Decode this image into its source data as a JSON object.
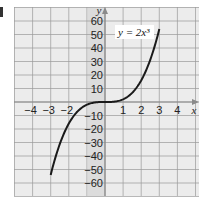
{
  "corner_label": "1",
  "chart_data": {
    "type": "line",
    "title": "",
    "equation_label": "y = 2x³",
    "xlabel": "x",
    "ylabel": "y",
    "xlim": [
      -5,
      5
    ],
    "ylim": [
      -70,
      70
    ],
    "x_ticks": [
      -4,
      -3,
      -2,
      -1,
      1,
      2,
      3,
      4
    ],
    "x_tick_labels": [
      "−4",
      "−3",
      "−2",
      "1",
      "2",
      "3",
      "4"
    ],
    "y_ticks": [
      60,
      50,
      40,
      30,
      20,
      10,
      -10,
      -20,
      -30,
      -40,
      -50,
      -60
    ],
    "y_tick_labels": [
      "60",
      "50",
      "40",
      "30",
      "20",
      "10",
      "−10",
      "−20",
      "−30",
      "−40",
      "−50",
      "−60"
    ],
    "grid": true,
    "series": [
      {
        "name": "y = 2x³",
        "x": [
          -3,
          -2.5,
          -2,
          -1.5,
          -1,
          -0.5,
          0,
          0.5,
          1,
          1.5,
          2,
          2.5,
          3
        ],
        "y": [
          -54,
          -31.25,
          -16,
          -6.75,
          -2,
          -0.25,
          0,
          0.25,
          2,
          6.75,
          16,
          31.25,
          54
        ]
      }
    ],
    "colors": {
      "grid": "#9a9a9a",
      "background": "#ececec",
      "label_strip": "#dcdcdc",
      "curve": "#1a1a1a",
      "axis": "#8a8a8a"
    }
  }
}
